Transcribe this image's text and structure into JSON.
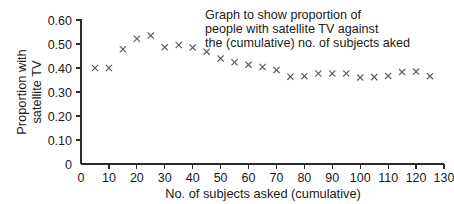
{
  "chart_data": {
    "type": "scatter",
    "title_lines": [
      "Graph to show proportion of",
      "people with satellite TV against",
      "the (cumulative) no. of subjects aked"
    ],
    "xlabel": "No. of subjects asked (cumulative)",
    "ylabel": "Proportion with satellite TV",
    "ylabel_lines": [
      "Proportion with",
      "satellite TV"
    ],
    "xlim": [
      0,
      130
    ],
    "ylim": [
      0,
      0.6
    ],
    "grid": false,
    "legend": null,
    "marker": "x",
    "marker_color": "#555a5e",
    "axis_color": "#2b2b2b",
    "xticks": [
      0,
      10,
      20,
      30,
      40,
      50,
      60,
      70,
      80,
      90,
      100,
      110,
      120,
      130
    ],
    "xtick_labels": [
      "0",
      "10",
      "20",
      "30",
      "40",
      "50",
      "60",
      "70",
      "80",
      "90",
      "100",
      "110",
      "120",
      "130"
    ],
    "yticks": [
      0,
      0.1,
      0.2,
      0.3,
      0.4,
      0.5,
      0.6
    ],
    "ytick_labels": [
      "0",
      "0.10",
      "0.20",
      "0.30",
      "0.40",
      "0.50",
      "0.60"
    ],
    "x": [
      5,
      10,
      15,
      20,
      25,
      30,
      35,
      40,
      45,
      50,
      55,
      60,
      65,
      70,
      75,
      80,
      85,
      90,
      95,
      100,
      105,
      110,
      115,
      120,
      125
    ],
    "y": [
      0.4,
      0.4,
      0.478,
      0.522,
      0.535,
      0.486,
      0.496,
      0.485,
      0.468,
      0.44,
      0.424,
      0.414,
      0.404,
      0.392,
      0.364,
      0.366,
      0.377,
      0.377,
      0.377,
      0.36,
      0.362,
      0.367,
      0.383,
      0.385,
      0.366
    ],
    "points": [
      {
        "x": 5,
        "y": 0.4
      },
      {
        "x": 10,
        "y": 0.4
      },
      {
        "x": 15,
        "y": 0.478
      },
      {
        "x": 20,
        "y": 0.522
      },
      {
        "x": 25,
        "y": 0.535
      },
      {
        "x": 30,
        "y": 0.486
      },
      {
        "x": 35,
        "y": 0.496
      },
      {
        "x": 40,
        "y": 0.485
      },
      {
        "x": 45,
        "y": 0.468
      },
      {
        "x": 50,
        "y": 0.44
      },
      {
        "x": 55,
        "y": 0.424
      },
      {
        "x": 60,
        "y": 0.414
      },
      {
        "x": 65,
        "y": 0.404
      },
      {
        "x": 70,
        "y": 0.392
      },
      {
        "x": 75,
        "y": 0.364
      },
      {
        "x": 80,
        "y": 0.366
      },
      {
        "x": 85,
        "y": 0.377
      },
      {
        "x": 90,
        "y": 0.377
      },
      {
        "x": 95,
        "y": 0.377
      },
      {
        "x": 100,
        "y": 0.36
      },
      {
        "x": 105,
        "y": 0.362
      },
      {
        "x": 110,
        "y": 0.367
      },
      {
        "x": 115,
        "y": 0.383
      },
      {
        "x": 120,
        "y": 0.385
      },
      {
        "x": 125,
        "y": 0.366
      }
    ]
  }
}
